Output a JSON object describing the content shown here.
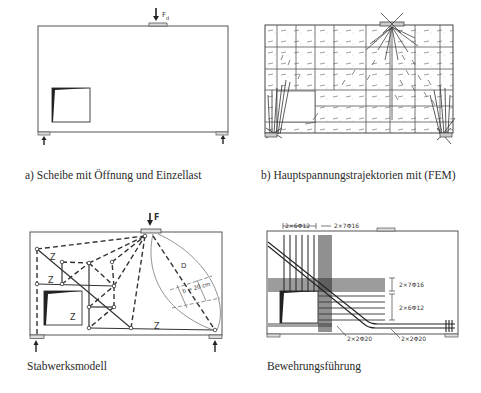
{
  "figures": {
    "a": {
      "caption": "a) Scheibe mit Öffnung und Einzellast",
      "load_label": "F",
      "load_subscript": "d"
    },
    "b": {
      "caption": "b) Hauptspannungstrajektorien mit (FEM)"
    },
    "c": {
      "caption": "Stabwerksmodell",
      "load_label": "F",
      "tie_labels": [
        "Z",
        "Z",
        "Z",
        "Z"
      ],
      "strut_label": "D",
      "width_label": "b ≈ 20 cm"
    },
    "d": {
      "caption": "Bewehrungsführung",
      "rebar_labels": {
        "top_left": "2×6Φ12",
        "top_right": "2×7Φ16",
        "right_upper": "2×7Φ16",
        "right_lower": "2×6Φ12",
        "bottom_left": "2×2Φ20",
        "bottom_right": "2×2Φ20"
      }
    }
  },
  "colors": {
    "line": "#3a3a3a",
    "light_line": "#8a8a8a",
    "background": "#ffffff"
  }
}
